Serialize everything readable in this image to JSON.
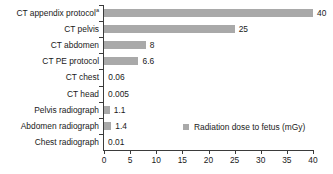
{
  "chart_data": {
    "type": "bar",
    "orientation": "horizontal",
    "title": "",
    "xlabel": "",
    "ylabel": "",
    "xlim": [
      0,
      40
    ],
    "grid": false,
    "legend_position": "inside-right",
    "bar_color": "#a9a9a9",
    "axis_color": "#3b3b3b",
    "categories": [
      "CT appendix protocol",
      "CT pelvis",
      "CT abdomen",
      "CT PE protocol",
      "CT chest",
      "CT head",
      "Pelvis radiograph",
      "Abdomen radiograph",
      "Chest radiograph"
    ],
    "category_footnotes": [
      "a",
      "",
      "",
      "",
      "",
      "",
      "",
      "",
      ""
    ],
    "values": [
      40,
      25,
      8,
      6.6,
      0.06,
      0.005,
      1.1,
      1.4,
      0.01
    ],
    "value_labels": [
      "40",
      "25",
      "8",
      "6.6",
      "0.06",
      "0.005",
      "1.1",
      "1.4",
      "0.01"
    ],
    "xticks": [
      0,
      5,
      10,
      15,
      20,
      25,
      30,
      35,
      40
    ],
    "xtick_labels": [
      "0",
      "5",
      "10",
      "15",
      "20",
      "25",
      "30",
      "35",
      "40"
    ],
    "series": [
      {
        "name": "Radiation dose to fetus (mGy)",
        "values": [
          40,
          25,
          8,
          6.6,
          0.06,
          0.005,
          1.1,
          1.4,
          0.01
        ]
      }
    ],
    "legend": [
      "Radiation dose to fetus (mGy)"
    ]
  }
}
